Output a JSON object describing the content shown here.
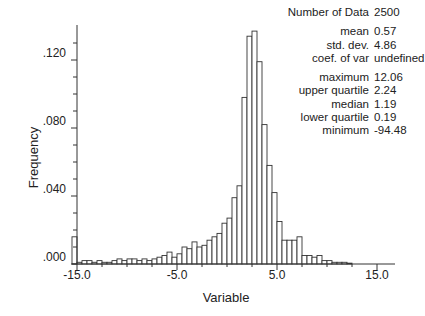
{
  "chart_data": {
    "type": "bar",
    "title": "",
    "xlabel": "Variable",
    "ylabel": "Frequency",
    "xlim": [
      -15.5,
      17.0
    ],
    "ylim": [
      0.0,
      0.14
    ],
    "x_ticks": [
      "-15.0",
      "-5.0",
      "5.0",
      "15.0"
    ],
    "y_ticks": [
      ".000",
      ".040",
      ".080",
      ".120"
    ],
    "grid": false,
    "legend": "none",
    "bin_width": 0.5,
    "bin_starts": [
      -15.5,
      -15.0,
      -14.5,
      -14.0,
      -13.5,
      -13.0,
      -12.5,
      -12.0,
      -11.5,
      -11.0,
      -10.5,
      -10.0,
      -9.5,
      -9.0,
      -8.5,
      -8.0,
      -7.5,
      -7.0,
      -6.5,
      -6.0,
      -5.5,
      -5.0,
      -4.5,
      -4.0,
      -3.5,
      -3.0,
      -2.5,
      -2.0,
      -1.5,
      -1.0,
      -0.5,
      0.0,
      0.5,
      1.0,
      1.5,
      2.0,
      2.5,
      3.0,
      3.5,
      4.0,
      4.5,
      5.0,
      5.5,
      6.0,
      6.5,
      7.0,
      7.5,
      8.0,
      8.5,
      9.0,
      9.5,
      10.0,
      10.5,
      11.0,
      11.5,
      12.0
    ],
    "values": [
      0.016,
      0.001,
      0.002,
      0.002,
      0.001,
      0.002,
      0.001,
      0.001,
      0.002,
      0.003,
      0.002,
      0.003,
      0.003,
      0.002,
      0.003,
      0.002,
      0.003,
      0.004,
      0.005,
      0.007,
      0.004,
      0.006,
      0.01,
      0.009,
      0.013,
      0.01,
      0.011,
      0.014,
      0.016,
      0.018,
      0.024,
      0.027,
      0.039,
      0.046,
      0.098,
      0.134,
      0.137,
      0.119,
      0.082,
      0.058,
      0.042,
      0.025,
      0.014,
      0.014,
      0.014,
      0.016,
      0.005,
      0.005,
      0.004,
      0.005,
      0.002,
      0.002,
      0.001,
      0.001,
      0.001,
      0.0005
    ],
    "statistics": [
      {
        "label": "Number of Data",
        "value": "2500"
      },
      {
        "label": "mean",
        "value": "0.57"
      },
      {
        "label": "std. dev.",
        "value": "4.86"
      },
      {
        "label": "coef. of var",
        "value": "undefined"
      },
      {
        "label": "maximum",
        "value": "12.06"
      },
      {
        "label": "upper quartile",
        "value": "2.24"
      },
      {
        "label": "median",
        "value": "1.19"
      },
      {
        "label": "lower quartile",
        "value": "0.19"
      },
      {
        "label": "minimum",
        "value": "-94.48"
      }
    ]
  },
  "colors": {
    "bar_fill": "#ffffff",
    "bar_stroke": "#333333",
    "axis": "#333333",
    "text": "#222222"
  }
}
